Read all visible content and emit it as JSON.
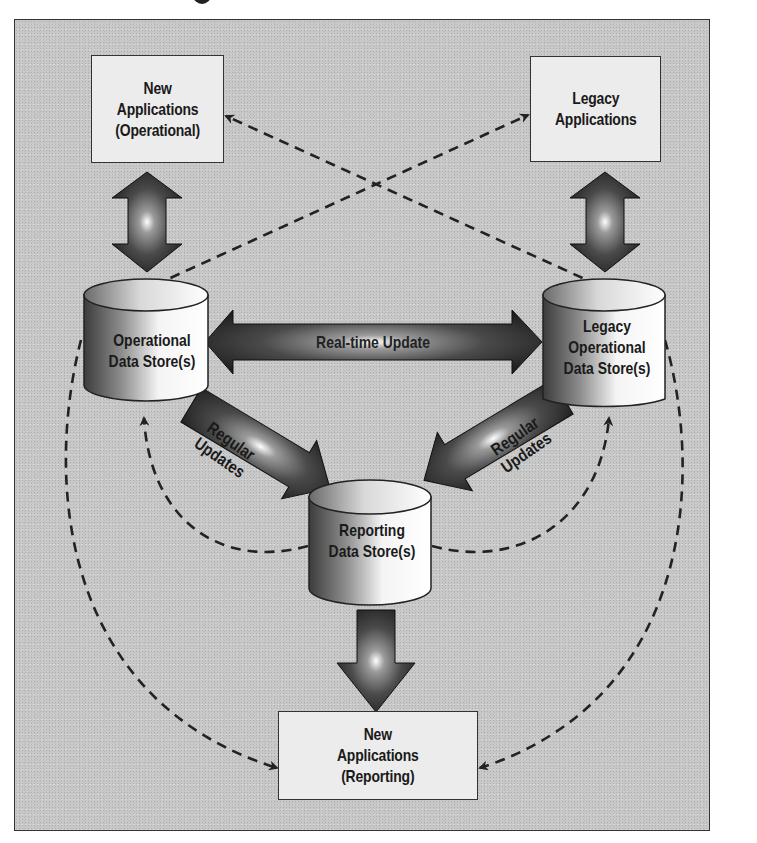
{
  "figure": {
    "title_fragment": "g",
    "background_color": "#c8c8c8",
    "box_fill": "#ececec",
    "stroke_color": "#333333"
  },
  "nodes": {
    "new_apps_operational": {
      "label": "New\nApplications\n(Operational)",
      "type": "box"
    },
    "legacy_apps": {
      "label": "Legacy\nApplications",
      "type": "box"
    },
    "operational_ds": {
      "label": "Operational\nData Store(s)",
      "type": "cylinder"
    },
    "legacy_operational_ds": {
      "label": "Legacy\nOperational\nData Store(s)",
      "type": "cylinder"
    },
    "reporting_ds": {
      "label": "Reporting\nData Store(s)",
      "type": "cylinder"
    },
    "new_apps_reporting": {
      "label": "New\nApplications\n(Reporting)",
      "type": "box"
    }
  },
  "edges": {
    "realtime": {
      "label": "Real-time Update",
      "from": "operational_ds",
      "to": "legacy_operational_ds",
      "style": "bidirectional-block"
    },
    "regular_left": {
      "label": "Regular\nUpdates",
      "from": "operational_ds",
      "to": "reporting_ds",
      "style": "block"
    },
    "regular_right": {
      "label": "Regular\nUpdates",
      "from": "legacy_operational_ds",
      "to": "reporting_ds",
      "style": "block"
    },
    "ops_app_link": {
      "from": "new_apps_operational",
      "to": "operational_ds",
      "style": "bidirectional-block"
    },
    "legacy_app_link": {
      "from": "legacy_apps",
      "to": "legacy_operational_ds",
      "style": "bidirectional-block"
    },
    "reporting_out": {
      "from": "reporting_ds",
      "to": "new_apps_reporting",
      "style": "block"
    },
    "dashed": [
      {
        "from": "legacy_operational_ds",
        "to": "new_apps_operational",
        "style": "dashed"
      },
      {
        "from": "operational_ds",
        "to": "legacy_apps",
        "style": "dashed"
      },
      {
        "from": "reporting_ds",
        "to": "operational_ds",
        "style": "dashed-curve"
      },
      {
        "from": "reporting_ds",
        "to": "legacy_operational_ds",
        "style": "dashed-curve"
      },
      {
        "from": "operational_ds",
        "to": "new_apps_reporting",
        "style": "dashed-curve"
      },
      {
        "from": "legacy_operational_ds",
        "to": "new_apps_reporting",
        "style": "dashed-curve"
      }
    ]
  }
}
